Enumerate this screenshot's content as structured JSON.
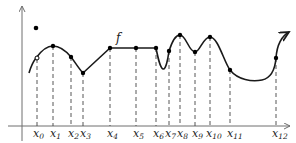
{
  "diagram": {
    "function_label": "f",
    "x_labels": [
      {
        "base": "x",
        "sub": "0"
      },
      {
        "base": "x",
        "sub": "1"
      },
      {
        "base": "x",
        "sub": "2"
      },
      {
        "base": "x",
        "sub": "3"
      },
      {
        "base": "x",
        "sub": "4"
      },
      {
        "base": "x",
        "sub": "5"
      },
      {
        "base": "x",
        "sub": "6"
      },
      {
        "base": "x",
        "sub": "7"
      },
      {
        "base": "x",
        "sub": "8"
      },
      {
        "base": "x",
        "sub": "9"
      },
      {
        "base": "x",
        "sub": "10"
      },
      {
        "base": "x",
        "sub": "11"
      },
      {
        "base": "x",
        "sub": "12"
      }
    ],
    "colors": {
      "curve": "#1a1a1a",
      "axis": "#6e6e6e",
      "background": "#ffffff"
    }
  }
}
